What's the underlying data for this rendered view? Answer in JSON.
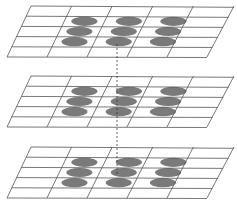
{
  "diagram": {
    "colors": {
      "grid_line": "#555555",
      "ellipse_fill": "#7a7a7a",
      "dashed_line": "#333333",
      "background": "#ffffff"
    },
    "grid": {
      "columns": 5,
      "rows": 5,
      "skew_dx": 22
    },
    "layers": [
      {
        "name": "top-layer",
        "top_y": 6,
        "bottom_y": 57
      },
      {
        "name": "middle-layer",
        "top_y": 76,
        "bottom_y": 127
      },
      {
        "name": "bottom-layer",
        "top_y": 147,
        "bottom_y": 198
      }
    ],
    "ellipses_per_layer": {
      "rows": 3,
      "cols": 3
    },
    "dashed_line": {
      "x": 117,
      "from_y": 44,
      "to_y": 174
    }
  }
}
